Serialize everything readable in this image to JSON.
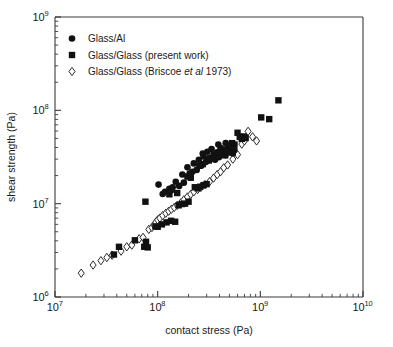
{
  "chart_data": {
    "type": "scatter",
    "title": "",
    "xlabel": "contact stress (Pa)",
    "ylabel": "shear strength (Pa)",
    "xscale": "log",
    "yscale": "log",
    "xlim": [
      10000000.0,
      10000000000.0
    ],
    "ylim": [
      1000000.0,
      1000000000.0
    ],
    "xticks": [
      10000000.0,
      100000000.0,
      1000000000.0,
      10000000000.0
    ],
    "xtick_labels": [
      "10^7",
      "10^8",
      "10^9",
      "10^10"
    ],
    "yticks": [
      1000000.0,
      10000000.0,
      100000000.0,
      1000000000.0
    ],
    "ytick_labels": [
      "10^6",
      "10^7",
      "10^8",
      "10^9"
    ],
    "grid": false,
    "legend_position": "upper-left",
    "series": [
      {
        "name": "Glass/Al",
        "marker": "filled-circle",
        "color": "#111111",
        "points": [
          [
            102000000.0,
            16000000.0
          ],
          [
            112000000.0,
            12700000.0
          ],
          [
            118000000.0,
            13400000.0
          ],
          [
            130000000.0,
            14400000.0
          ],
          [
            140000000.0,
            15000000.0
          ],
          [
            150000000.0,
            17200000.0
          ],
          [
            162000000.0,
            15500000.0
          ],
          [
            174000000.0,
            20500000.0
          ],
          [
            180000000.0,
            16800000.0
          ],
          [
            195000000.0,
            24500000.0
          ],
          [
            205000000.0,
            21000000.0
          ],
          [
            210000000.0,
            19000000.0
          ],
          [
            225000000.0,
            27000000.0
          ],
          [
            240000000.0,
            23000000.0
          ],
          [
            252000000.0,
            29500000.0
          ],
          [
            265000000.0,
            25500000.0
          ],
          [
            280000000.0,
            32000000.0
          ],
          [
            295000000.0,
            28000000.0
          ],
          [
            305000000.0,
            36000000.0
          ],
          [
            320000000.0,
            31000000.0
          ],
          [
            335000000.0,
            38500000.0
          ],
          [
            350000000.0,
            33500000.0
          ],
          [
            362000000.0,
            29500000.0
          ],
          [
            380000000.0,
            35500000.0
          ],
          [
            395000000.0,
            31500000.0
          ],
          [
            410000000.0,
            39500000.0
          ],
          [
            425000000.0,
            34500000.0
          ],
          [
            440000000.0,
            38000000.0
          ],
          [
            455000000.0,
            33000000.0
          ],
          [
            470000000.0,
            37000000.0
          ],
          [
            485000000.0,
            41000000.0
          ],
          [
            500000000.0,
            35500000.0
          ],
          [
            520000000.0,
            39000000.0
          ],
          [
            540000000.0,
            34500000.0
          ],
          [
            560000000.0,
            37500000.0
          ],
          [
            135000000.0,
            13800000.0
          ],
          [
            218000000.0,
            22000000.0
          ],
          [
            390000000.0,
            43000000.0
          ],
          [
            460000000.0,
            44500000.0
          ],
          [
            275000000.0,
            34500000.0
          ]
        ]
      },
      {
        "name": "Glass/Glass (present work)",
        "marker": "filled-square",
        "color": "#111111",
        "points": [
          [
            37500000.0,
            2850000.0
          ],
          [
            42000000.0,
            3450000.0
          ],
          [
            60000000.0,
            4050000.0
          ],
          [
            74000000.0,
            3450000.0
          ],
          [
            77000000.0,
            3900000.0
          ],
          [
            80000000.0,
            3400000.0
          ],
          [
            76000000.0,
            10500000.0
          ],
          [
            95000000.0,
            5700000.0
          ],
          [
            100000000.0,
            5650000.0
          ],
          [
            110000000.0,
            6000000.0
          ],
          [
            122000000.0,
            6300000.0
          ],
          [
            135000000.0,
            6550000.0
          ],
          [
            148000000.0,
            6400000.0
          ],
          [
            160000000.0,
            9600000.0
          ],
          [
            172000000.0,
            9900000.0
          ],
          [
            185000000.0,
            10000000.0
          ],
          [
            200000000.0,
            10500000.0
          ],
          [
            130000000.0,
            12600000.0
          ],
          [
            155000000.0,
            13000000.0
          ],
          [
            195000000.0,
            19500000.0
          ],
          [
            210000000.0,
            19000000.0
          ],
          [
            230000000.0,
            15000000.0
          ],
          [
            245000000.0,
            14600000.0
          ],
          [
            260000000.0,
            15200000.0
          ],
          [
            280000000.0,
            15800000.0
          ],
          [
            300000000.0,
            16200000.0
          ],
          [
            255000000.0,
            25500000.0
          ],
          [
            275000000.0,
            26500000.0
          ],
          [
            315000000.0,
            29000000.0
          ],
          [
            340000000.0,
            30500000.0
          ],
          [
            430000000.0,
            34500000.0
          ],
          [
            455000000.0,
            33000000.0
          ],
          [
            480000000.0,
            35500000.0
          ],
          [
            530000000.0,
            44500000.0
          ],
          [
            560000000.0,
            43000000.0
          ],
          [
            600000000.0,
            57500000.0
          ],
          [
            630000000.0,
            52000000.0
          ],
          [
            660000000.0,
            49500000.0
          ],
          [
            690000000.0,
            52500000.0
          ],
          [
            720000000.0,
            50500000.0
          ],
          [
            1020000000.0,
            84000000.0
          ],
          [
            1220000000.0,
            80500000.0
          ],
          [
            1500000000.0,
            128000000.0
          ]
        ]
      },
      {
        "name": "Glass/Glass (Briscoe et al 1973)",
        "marker": "open-diamond",
        "color": "#ffffff",
        "edge_color": "#2b2b2b",
        "points": [
          [
            18000000.0,
            1800000.0
          ],
          [
            23500000.0,
            2200000.0
          ],
          [
            28000000.0,
            2450000.0
          ],
          [
            32000000.0,
            2650000.0
          ],
          [
            36000000.0,
            2800000.0
          ],
          [
            44000000.0,
            3100000.0
          ],
          [
            50000000.0,
            3450000.0
          ],
          [
            56000000.0,
            3600000.0
          ],
          [
            66000000.0,
            4200000.0
          ],
          [
            72000000.0,
            4350000.0
          ],
          [
            82000000.0,
            5300000.0
          ],
          [
            88000000.0,
            5550000.0
          ],
          [
            92000000.0,
            5900000.0
          ],
          [
            96000000.0,
            6350000.0
          ],
          [
            100000000.0,
            6700000.0
          ],
          [
            105000000.0,
            7000000.0
          ],
          [
            112000000.0,
            7450000.0
          ],
          [
            120000000.0,
            7900000.0
          ],
          [
            128000000.0,
            8300000.0
          ],
          [
            136000000.0,
            8700000.0
          ],
          [
            145000000.0,
            9100000.0
          ],
          [
            155000000.0,
            9600000.0
          ],
          [
            168000000.0,
            10200000.0
          ],
          [
            180000000.0,
            11000000.0
          ],
          [
            195000000.0,
            11800000.0
          ],
          [
            210000000.0,
            12600000.0
          ],
          [
            225000000.0,
            13400000.0
          ],
          [
            245000000.0,
            14200000.0
          ],
          [
            265000000.0,
            15000000.0
          ],
          [
            290000000.0,
            16000000.0
          ],
          [
            320000000.0,
            17200000.0
          ],
          [
            350000000.0,
            18800000.0
          ],
          [
            380000000.0,
            20500000.0
          ],
          [
            410000000.0,
            22000000.0
          ],
          [
            440000000.0,
            24200000.0
          ],
          [
            480000000.0,
            26000000.0
          ],
          [
            540000000.0,
            30000000.0
          ],
          [
            600000000.0,
            33500000.0
          ],
          [
            660000000.0,
            43500000.0
          ],
          [
            700000000.0,
            47000000.0
          ],
          [
            760000000.0,
            59500000.0
          ],
          [
            840000000.0,
            52000000.0
          ],
          [
            920000000.0,
            47000000.0
          ]
        ]
      }
    ]
  },
  "legend": {
    "items": [
      {
        "label": "Glass/Al",
        "marker": "filled-circle"
      },
      {
        "label": "Glass/Glass (present work)",
        "marker": "filled-square"
      },
      {
        "label": "Glass/Glass (Briscoe ",
        "italic": "et al",
        "label_tail": " 1973)",
        "marker": "open-diamond"
      }
    ]
  },
  "axes": {
    "x_title": "contact stress (Pa)",
    "y_title": "shear strength (Pa)",
    "x_labels": [
      {
        "base": "10",
        "exp": "7"
      },
      {
        "base": "10",
        "exp": "8"
      },
      {
        "base": "10",
        "exp": "9"
      },
      {
        "base": "10",
        "exp": "10"
      }
    ],
    "y_labels": [
      {
        "base": "10",
        "exp": "6"
      },
      {
        "base": "10",
        "exp": "7"
      },
      {
        "base": "10",
        "exp": "8"
      },
      {
        "base": "10",
        "exp": "9"
      }
    ]
  },
  "colors": {
    "axis": "#3a3a3a",
    "text": "#1a1a1a",
    "marker_fill": "#111111",
    "marker_open_edge": "#2b2b2b",
    "background": "#ffffff"
  }
}
